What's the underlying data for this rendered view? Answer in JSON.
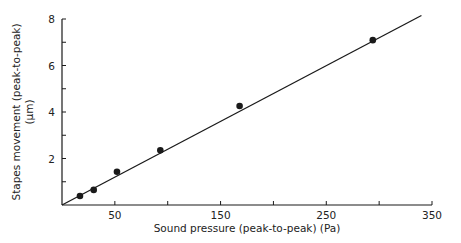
{
  "chart_data": {
    "type": "scatter",
    "title": "",
    "xlabel": "Sound pressure (peak-to-peak) (Pa)",
    "ylabel": "Stapes movement (peak-to-peak)",
    "ylabel_unit": "(µm)",
    "xlim": [
      0,
      350
    ],
    "ylim": [
      0,
      8
    ],
    "x_ticks": [
      0,
      50,
      100,
      150,
      200,
      250,
      300,
      350
    ],
    "x_tick_labels": [
      "",
      "50",
      "",
      "150",
      "",
      "250",
      "",
      "350"
    ],
    "y_ticks": [
      0,
      1,
      2,
      3,
      4,
      5,
      6,
      7,
      8
    ],
    "y_tick_labels": [
      "",
      "",
      "2",
      "",
      "4",
      "",
      "6",
      "",
      "8"
    ],
    "grid": false,
    "legend": null,
    "series": [
      {
        "name": "measured",
        "marker": "filled-circle",
        "x": [
          17,
          30,
          52,
          93,
          168,
          294
        ],
        "y": [
          0.39,
          0.65,
          1.43,
          2.35,
          4.26,
          7.09
        ]
      }
    ],
    "fit_line": {
      "name": "linear fit",
      "x": [
        0,
        340
      ],
      "y": [
        0,
        8.15
      ]
    }
  },
  "colors": {
    "ink": "#1a1a1a",
    "background": "#ffffff"
  }
}
